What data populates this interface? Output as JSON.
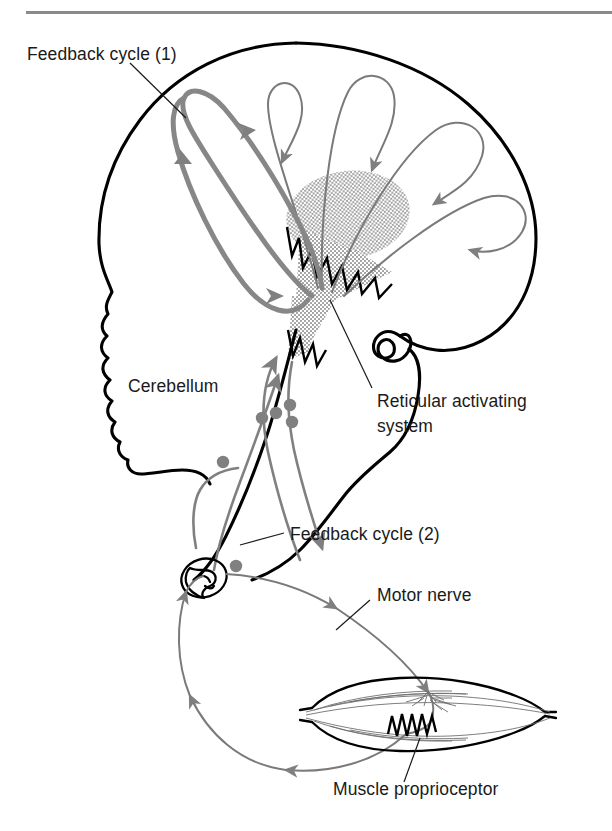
{
  "figure": {
    "kind": "anatomical-diagram",
    "background_color": "#ffffff",
    "top_rule": {
      "color": "#8a8a8a",
      "x": 26,
      "y": 11,
      "width": 586,
      "height": 3
    }
  },
  "labels": {
    "feedback_cycle_1": "Feedback cycle (1)",
    "cerebellum": "Cerebellum",
    "reticular_activating_system_line1": "Reticular activating",
    "reticular_activating_system_line2": "system",
    "feedback_cycle_2": "Feedback cycle (2)",
    "motor_nerve": "Motor nerve",
    "muscle_proprioceptor": "Muscle proprioceptor"
  },
  "structures": {
    "cerebrum": "cerebral-hemisphere-outline",
    "cerebellum": "cerebellum-outline",
    "brainstem": "brainstem-outline",
    "reticular_formation": "reticular-formation-stipple",
    "spinal_cord": "spinal-cord-cross-section",
    "muscle": "skeletal-muscle-belly",
    "proprioceptor": "muscle-spindle-zigzag",
    "motor_endplate": "motor-endplate-branching"
  },
  "colors": {
    "ink": "#000000",
    "label_text": "#1a1a1a",
    "pathway_gray": "#7f7f7f",
    "pathway_gray_heavy": "#878787",
    "stipple_gray": "#9a9a9a",
    "rule_gray": "#8a8a8a",
    "page": "#ffffff"
  },
  "pathways": {
    "cortical_projection_arrows": 5,
    "feedback_loop_1": "thick-gray-loop-left-cortex-to-reticular-formation",
    "feedback_loop_2": "gray-loop-brainstem-to-cerebellum-and-spinal-cord",
    "peripheral_loop": "gray-loop-spinal-cord-to-muscle-and-back",
    "synaptic_nodes": 5
  }
}
